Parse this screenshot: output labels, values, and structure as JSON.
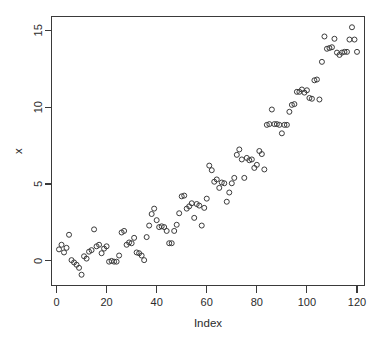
{
  "chart_data": {
    "type": "scatter",
    "title": "",
    "xlabel": "Index",
    "ylabel": "x",
    "xlim": [
      -2,
      123
    ],
    "ylim": [
      -1.6,
      15.9
    ],
    "xticks": [
      0,
      20,
      40,
      60,
      80,
      100,
      120
    ],
    "yticks": [
      0,
      5,
      10,
      15
    ],
    "xtick_labels": [
      "0",
      "20",
      "40",
      "60",
      "80",
      "100",
      "120"
    ],
    "ytick_labels": [
      "0",
      "5",
      "10",
      "15"
    ],
    "grid": false,
    "legend": null,
    "marker": "open-circle",
    "marker_color": "#3b3b3b",
    "marker_radius": 2.5,
    "box": true,
    "ylabel_rotation": 90,
    "ytick_label_rotation": 90,
    "n_points": 120,
    "x": [
      1,
      2,
      3,
      4,
      5,
      6,
      7,
      8,
      9,
      10,
      11,
      12,
      13,
      14,
      15,
      16,
      17,
      18,
      19,
      20,
      21,
      22,
      23,
      24,
      25,
      26,
      27,
      28,
      29,
      30,
      31,
      32,
      33,
      34,
      35,
      36,
      37,
      38,
      39,
      40,
      41,
      42,
      43,
      44,
      45,
      46,
      47,
      48,
      49,
      50,
      51,
      52,
      53,
      54,
      55,
      56,
      57,
      58,
      59,
      60,
      61,
      62,
      63,
      64,
      65,
      66,
      67,
      68,
      69,
      70,
      71,
      72,
      73,
      74,
      75,
      76,
      77,
      78,
      79,
      80,
      81,
      82,
      83,
      84,
      85,
      86,
      87,
      88,
      89,
      90,
      91,
      92,
      93,
      94,
      95,
      96,
      97,
      98,
      99,
      100,
      101,
      102,
      103,
      104,
      105,
      106,
      107,
      108,
      109,
      110,
      111,
      112,
      113,
      114,
      115,
      116,
      117,
      118,
      119,
      120
    ],
    "y": [
      0.75,
      1.05,
      0.55,
      0.85,
      1.7,
      0.05,
      -0.1,
      -0.25,
      -0.45,
      -0.9,
      0.3,
      0.15,
      0.6,
      0.7,
      2.05,
      0.95,
      1.05,
      0.5,
      0.8,
      0.95,
      -0.05,
      0.0,
      -0.05,
      -0.05,
      0.35,
      1.85,
      1.95,
      1.05,
      1.2,
      1.15,
      1.5,
      0.55,
      0.5,
      0.35,
      0.05,
      1.55,
      2.3,
      3.05,
      3.4,
      2.65,
      2.2,
      2.25,
      2.2,
      1.95,
      1.15,
      1.15,
      1.95,
      2.35,
      3.1,
      4.2,
      4.25,
      3.4,
      3.55,
      3.75,
      2.8,
      3.7,
      3.6,
      2.3,
      3.45,
      4.05,
      6.2,
      5.9,
      5.15,
      5.3,
      4.75,
      5.1,
      5.05,
      3.85,
      4.45,
      5.05,
      5.4,
      6.9,
      7.25,
      6.6,
      5.4,
      6.7,
      6.55,
      6.6,
      6.05,
      6.25,
      7.15,
      6.95,
      5.95,
      8.85,
      8.9,
      9.85,
      8.9,
      8.9,
      8.85,
      8.3,
      8.85,
      8.85,
      9.7,
      10.15,
      10.2,
      11.0,
      11.0,
      11.15,
      10.95,
      11.1,
      10.6,
      10.55,
      11.75,
      11.8,
      10.5,
      12.95,
      14.6,
      13.8,
      13.85,
      13.9,
      14.45,
      13.55,
      13.4,
      13.55,
      13.6,
      13.6,
      14.4,
      15.2,
      14.4,
      13.6
    ]
  },
  "axes": {
    "x_title": "Index",
    "y_title": "x"
  }
}
